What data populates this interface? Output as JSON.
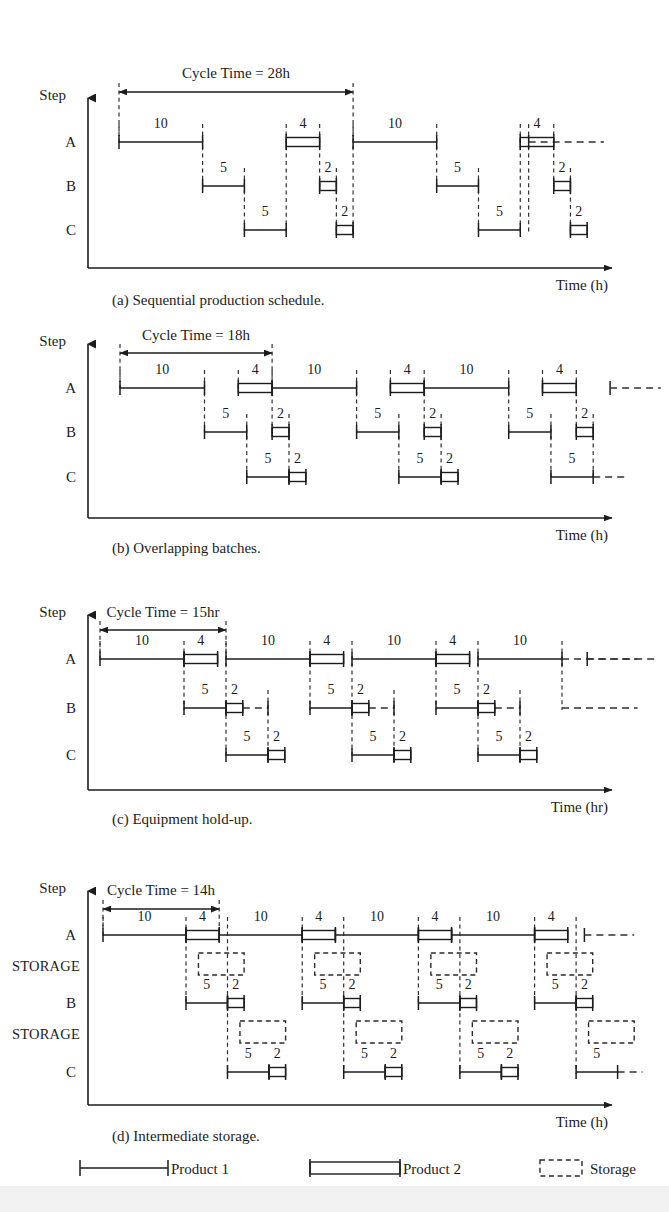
{
  "figure": {
    "axis": {
      "step_axis_label": "Step",
      "row_labels": [
        "A",
        "B",
        "C"
      ],
      "storage_label": "STORAGE"
    },
    "ink_color": "#1c1c1c",
    "background": "#ffffff",
    "scale_px_per_hour": 8.4
  },
  "legend": {
    "items": [
      {
        "key": "product1",
        "label": "Product 1",
        "style": "single-line-with-endcaps"
      },
      {
        "key": "product2",
        "label": "Product 2",
        "style": "double-line-rectangle"
      },
      {
        "key": "storage",
        "label": "Storage",
        "style": "dashed-box"
      }
    ]
  },
  "panels": [
    {
      "id": "a",
      "caption": "(a) Sequential production schedule.",
      "cycle_label": "Cycle Time = 28h",
      "cycle_time_hours": 28,
      "time_axis_label": "Time (h)",
      "origin_hour": 0,
      "rows": [
        "A",
        "B",
        "C"
      ],
      "storage_rows": [],
      "cycle_marks": [
        0,
        28
      ],
      "tail_continuation": {
        "row": "A",
        "start": 49,
        "end": 58
      },
      "tasks": [
        {
          "row": "A",
          "product": 1,
          "start": 0,
          "duration": 10,
          "label": "10"
        },
        {
          "row": "B",
          "product": 1,
          "start": 10,
          "duration": 5,
          "label": "5"
        },
        {
          "row": "C",
          "product": 1,
          "start": 15,
          "duration": 5,
          "label": "5"
        },
        {
          "row": "A",
          "product": 2,
          "start": 20,
          "duration": 4,
          "label": "4"
        },
        {
          "row": "B",
          "product": 2,
          "start": 24,
          "duration": 2,
          "label": "2"
        },
        {
          "row": "C",
          "product": 2,
          "start": 26,
          "duration": 2,
          "label": "2"
        },
        {
          "row": "A",
          "product": 1,
          "start": 28,
          "duration": 10,
          "label": "10"
        },
        {
          "row": "B",
          "product": 1,
          "start": 38,
          "duration": 5,
          "label": "5"
        },
        {
          "row": "C",
          "product": 1,
          "start": 43,
          "duration": 5,
          "label": "5"
        },
        {
          "row": "A",
          "product": 2,
          "start": 48,
          "duration": 4,
          "label": "4"
        },
        {
          "row": "B",
          "product": 2,
          "start": 52,
          "duration": 2,
          "label": "2"
        },
        {
          "row": "C",
          "product": 2,
          "start": 54,
          "duration": 2,
          "label": "2"
        }
      ],
      "dashed_links": [
        {
          "x": 0,
          "from_row": "A",
          "to_row": "A"
        },
        {
          "x": 10,
          "from_row": "A",
          "to_row": "B"
        },
        {
          "x": 15,
          "from_row": "B",
          "to_row": "C"
        },
        {
          "x": 20,
          "from_row": "A",
          "to_row": "C"
        },
        {
          "x": 24,
          "from_row": "A",
          "to_row": "B"
        },
        {
          "x": 26,
          "from_row": "B",
          "to_row": "C"
        },
        {
          "x": 28,
          "from_row": "A",
          "to_row": "C"
        },
        {
          "x": 38,
          "from_row": "A",
          "to_row": "B"
        },
        {
          "x": 43,
          "from_row": "B",
          "to_row": "C"
        },
        {
          "x": 48,
          "from_row": "A",
          "to_row": "C"
        },
        {
          "x": 52,
          "from_row": "A",
          "to_row": "B"
        },
        {
          "x": 54,
          "from_row": "B",
          "to_row": "C"
        },
        {
          "x": 49,
          "from_row": "A",
          "to_row": "C"
        }
      ]
    },
    {
      "id": "b",
      "caption": "(b) Overlapping batches.",
      "cycle_label": "Cycle Time = 18h",
      "cycle_time_hours": 18,
      "time_axis_label": "Time (h)",
      "origin_hour": 0,
      "rows": [
        "A",
        "B",
        "C"
      ],
      "storage_rows": [],
      "cycle_marks": [
        0,
        18
      ],
      "tail_continuation": {
        "row": "A",
        "start": 58,
        "end": 64
      },
      "tasks": [
        {
          "row": "A",
          "product": 1,
          "start": 0,
          "duration": 10,
          "label": "10"
        },
        {
          "row": "B",
          "product": 1,
          "start": 10,
          "duration": 5,
          "label": "5"
        },
        {
          "row": "C",
          "product": 1,
          "start": 15,
          "duration": 5,
          "label": "5"
        },
        {
          "row": "A",
          "product": 2,
          "start": 14,
          "duration": 4,
          "label": "4"
        },
        {
          "row": "B",
          "product": 2,
          "start": 18,
          "duration": 2,
          "label": "2"
        },
        {
          "row": "C",
          "product": 2,
          "start": 20,
          "duration": 2,
          "label": "2"
        },
        {
          "row": "A",
          "product": 1,
          "start": 18,
          "duration": 10,
          "label": "10"
        },
        {
          "row": "B",
          "product": 1,
          "start": 28,
          "duration": 5,
          "label": "5"
        },
        {
          "row": "C",
          "product": 1,
          "start": 33,
          "duration": 5,
          "label": "5"
        },
        {
          "row": "A",
          "product": 2,
          "start": 32,
          "duration": 4,
          "label": "4"
        },
        {
          "row": "B",
          "product": 2,
          "start": 36,
          "duration": 2,
          "label": "2"
        },
        {
          "row": "C",
          "product": 2,
          "start": 38,
          "duration": 2,
          "label": "2"
        },
        {
          "row": "A",
          "product": 1,
          "start": 36,
          "duration": 10,
          "label": "10"
        },
        {
          "row": "B",
          "product": 1,
          "start": 46,
          "duration": 5,
          "label": "5"
        },
        {
          "row": "C",
          "product": 1,
          "start": 51,
          "duration": 5,
          "label": "5"
        },
        {
          "row": "A",
          "product": 2,
          "start": 50,
          "duration": 4,
          "label": "4"
        },
        {
          "row": "B",
          "product": 2,
          "start": 54,
          "duration": 2,
          "label": "2"
        }
      ],
      "dashed_links": [
        {
          "x": 0,
          "from_row": "A",
          "to_row": "A"
        },
        {
          "x": 10,
          "from_row": "A",
          "to_row": "B"
        },
        {
          "x": 15,
          "from_row": "B",
          "to_row": "C"
        },
        {
          "x": 14,
          "from_row": "A",
          "to_row": "A"
        },
        {
          "x": 18,
          "from_row": "A",
          "to_row": "B"
        },
        {
          "x": 20,
          "from_row": "B",
          "to_row": "C"
        },
        {
          "x": 28,
          "from_row": "A",
          "to_row": "B"
        },
        {
          "x": 33,
          "from_row": "B",
          "to_row": "C"
        },
        {
          "x": 32,
          "from_row": "A",
          "to_row": "A"
        },
        {
          "x": 36,
          "from_row": "A",
          "to_row": "B"
        },
        {
          "x": 38,
          "from_row": "B",
          "to_row": "C"
        },
        {
          "x": 46,
          "from_row": "A",
          "to_row": "B"
        },
        {
          "x": 51,
          "from_row": "B",
          "to_row": "C"
        },
        {
          "x": 50,
          "from_row": "A",
          "to_row": "A"
        },
        {
          "x": 54,
          "from_row": "A",
          "to_row": "B"
        },
        {
          "x": 56,
          "from_row": "B",
          "to_row": "C"
        }
      ],
      "tail_dashes": [
        {
          "row": "C",
          "start": 56,
          "end": 60
        }
      ]
    },
    {
      "id": "c",
      "caption": "(c) Equipment hold-up.",
      "cycle_label": "Cycle Time = 15hr",
      "cycle_time_hours": 15,
      "time_axis_label": "Time (hr)",
      "origin_hour": 0,
      "rows": [
        "A",
        "B",
        "C"
      ],
      "storage_rows": [],
      "cycle_marks": [
        0,
        15
      ],
      "tail_continuation": {
        "row": "A",
        "start": 58,
        "end": 66
      },
      "tasks": [
        {
          "row": "A",
          "product": 1,
          "start": 0,
          "duration": 10,
          "label": "10"
        },
        {
          "row": "A",
          "product": 2,
          "start": 10,
          "duration": 4,
          "label": "4"
        },
        {
          "row": "B",
          "product": 1,
          "start": 10,
          "duration": 5,
          "label": "5"
        },
        {
          "row": "B",
          "product": 2,
          "start": 15,
          "duration": 2,
          "label": "2"
        },
        {
          "row": "C",
          "product": 1,
          "start": 15,
          "duration": 5,
          "label": "5"
        },
        {
          "row": "C",
          "product": 2,
          "start": 20,
          "duration": 2,
          "label": "2"
        },
        {
          "row": "A",
          "product": 1,
          "start": 15,
          "duration": 10,
          "label": "10"
        },
        {
          "row": "A",
          "product": 2,
          "start": 25,
          "duration": 4,
          "label": "4"
        },
        {
          "row": "B",
          "product": 1,
          "start": 25,
          "duration": 5,
          "label": "5"
        },
        {
          "row": "B",
          "product": 2,
          "start": 30,
          "duration": 2,
          "label": "2"
        },
        {
          "row": "C",
          "product": 1,
          "start": 30,
          "duration": 5,
          "label": "5"
        },
        {
          "row": "C",
          "product": 2,
          "start": 35,
          "duration": 2,
          "label": "2"
        },
        {
          "row": "A",
          "product": 1,
          "start": 30,
          "duration": 10,
          "label": "10"
        },
        {
          "row": "A",
          "product": 2,
          "start": 40,
          "duration": 4,
          "label": "4"
        },
        {
          "row": "B",
          "product": 1,
          "start": 40,
          "duration": 5,
          "label": "5"
        },
        {
          "row": "B",
          "product": 2,
          "start": 45,
          "duration": 2,
          "label": "2"
        },
        {
          "row": "C",
          "product": 1,
          "start": 45,
          "duration": 5,
          "label": "5"
        },
        {
          "row": "C",
          "product": 2,
          "start": 50,
          "duration": 2,
          "label": "2"
        },
        {
          "row": "A",
          "product": 1,
          "start": 45,
          "duration": 10,
          "label": "10"
        }
      ],
      "holdups": [
        {
          "row": "B",
          "start": 17,
          "end": 20
        },
        {
          "row": "B",
          "start": 32,
          "end": 35
        },
        {
          "row": "B",
          "start": 47,
          "end": 50
        }
      ],
      "dashed_links": [
        {
          "x": 0,
          "from_row": "A",
          "to_row": "A"
        },
        {
          "x": 10,
          "from_row": "A",
          "to_row": "B"
        },
        {
          "x": 15,
          "from_row": "A",
          "to_row": "C"
        },
        {
          "x": 20,
          "from_row": "B",
          "to_row": "C"
        },
        {
          "x": 25,
          "from_row": "A",
          "to_row": "B"
        },
        {
          "x": 30,
          "from_row": "A",
          "to_row": "C"
        },
        {
          "x": 35,
          "from_row": "B",
          "to_row": "C"
        },
        {
          "x": 40,
          "from_row": "A",
          "to_row": "B"
        },
        {
          "x": 45,
          "from_row": "A",
          "to_row": "C"
        },
        {
          "x": 50,
          "from_row": "B",
          "to_row": "C"
        },
        {
          "x": 55,
          "from_row": "A",
          "to_row": "B"
        }
      ],
      "tail_dashes": [
        {
          "row": "A",
          "start": 55,
          "end": 64
        },
        {
          "row": "B",
          "start": 55,
          "end": 64
        }
      ]
    },
    {
      "id": "d",
      "caption": "(d) Intermediate storage.",
      "cycle_label": "Cycle Time = 14h",
      "cycle_time_hours": 14,
      "time_axis_label": "Time (h)",
      "origin_hour": 0,
      "rows": [
        "A",
        "STORAGE",
        "B",
        "STORAGE",
        "C"
      ],
      "storage_rows": [
        "S1",
        "S2"
      ],
      "cycle_marks": [
        0,
        14
      ],
      "tail_continuation": {
        "row": "A",
        "start": 58,
        "end": 64
      },
      "tasks": [
        {
          "row": "A",
          "product": 1,
          "start": 0,
          "duration": 10,
          "label": "10"
        },
        {
          "row": "A",
          "product": 2,
          "start": 10,
          "duration": 4,
          "label": "4"
        },
        {
          "row": "B",
          "product": 1,
          "start": 10,
          "duration": 5,
          "label": "5"
        },
        {
          "row": "B",
          "product": 2,
          "start": 15,
          "duration": 2,
          "label": "2"
        },
        {
          "row": "C",
          "product": 1,
          "start": 15,
          "duration": 5,
          "label": "5"
        },
        {
          "row": "C",
          "product": 2,
          "start": 20,
          "duration": 2,
          "label": "2"
        },
        {
          "row": "A",
          "product": 1,
          "start": 14,
          "duration": 10,
          "label": "10"
        },
        {
          "row": "A",
          "product": 2,
          "start": 24,
          "duration": 4,
          "label": "4"
        },
        {
          "row": "B",
          "product": 1,
          "start": 24,
          "duration": 5,
          "label": "5"
        },
        {
          "row": "B",
          "product": 2,
          "start": 29,
          "duration": 2,
          "label": "2"
        },
        {
          "row": "C",
          "product": 1,
          "start": 29,
          "duration": 5,
          "label": "5"
        },
        {
          "row": "C",
          "product": 2,
          "start": 34,
          "duration": 2,
          "label": "2"
        },
        {
          "row": "A",
          "product": 1,
          "start": 28,
          "duration": 10,
          "label": "10"
        },
        {
          "row": "A",
          "product": 2,
          "start": 38,
          "duration": 4,
          "label": "4"
        },
        {
          "row": "B",
          "product": 1,
          "start": 38,
          "duration": 5,
          "label": "5"
        },
        {
          "row": "B",
          "product": 2,
          "start": 43,
          "duration": 2,
          "label": "2"
        },
        {
          "row": "C",
          "product": 1,
          "start": 43,
          "duration": 5,
          "label": "5"
        },
        {
          "row": "C",
          "product": 2,
          "start": 48,
          "duration": 2,
          "label": "2"
        },
        {
          "row": "A",
          "product": 1,
          "start": 42,
          "duration": 10,
          "label": "10"
        },
        {
          "row": "A",
          "product": 2,
          "start": 52,
          "duration": 4,
          "label": "4"
        },
        {
          "row": "B",
          "product": 1,
          "start": 52,
          "duration": 5,
          "label": "5"
        },
        {
          "row": "B",
          "product": 2,
          "start": 57,
          "duration": 2,
          "label": "2"
        },
        {
          "row": "C",
          "product": 1,
          "start": 57,
          "duration": 5,
          "label": "5"
        }
      ],
      "storage_boxes": [
        {
          "slot": "S1",
          "start": 11.5,
          "end": 17
        },
        {
          "slot": "S1",
          "start": 25.5,
          "end": 31
        },
        {
          "slot": "S1",
          "start": 39.5,
          "end": 45
        },
        {
          "slot": "S1",
          "start": 53.5,
          "end": 59
        },
        {
          "slot": "S2",
          "start": 16.5,
          "end": 22
        },
        {
          "slot": "S2",
          "start": 30.5,
          "end": 36
        },
        {
          "slot": "S2",
          "start": 44.5,
          "end": 50
        },
        {
          "slot": "S2",
          "start": 58.5,
          "end": 64
        }
      ],
      "dashed_links": [
        {
          "x": 0,
          "from_row": "A",
          "to_row": "A"
        },
        {
          "x": 10,
          "from_row": "A",
          "to_row": "B"
        },
        {
          "x": 15,
          "from_row": "A",
          "to_row": "C"
        },
        {
          "x": 24,
          "from_row": "A",
          "to_row": "B"
        },
        {
          "x": 29,
          "from_row": "A",
          "to_row": "C"
        },
        {
          "x": 38,
          "from_row": "A",
          "to_row": "B"
        },
        {
          "x": 43,
          "from_row": "A",
          "to_row": "C"
        },
        {
          "x": 52,
          "from_row": "A",
          "to_row": "B"
        },
        {
          "x": 57,
          "from_row": "A",
          "to_row": "C"
        }
      ],
      "tail_dashes": [
        {
          "row": "C",
          "start": 62,
          "end": 65
        }
      ]
    }
  ]
}
